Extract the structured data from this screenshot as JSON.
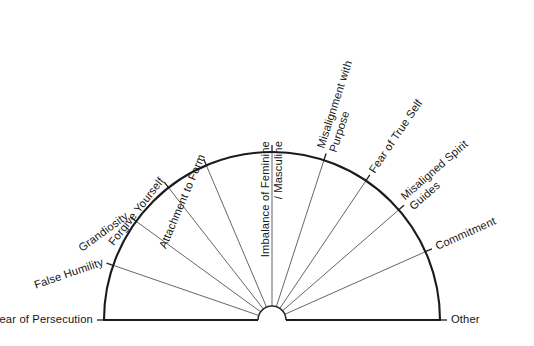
{
  "chart_data": {
    "type": "pie",
    "title": "",
    "subtitle": "",
    "xlabel": "",
    "ylabel": "",
    "orientation": "semicircle-upper",
    "arc_span_degrees": 180,
    "arc_start_degrees": 0,
    "arc_end_degrees": 180,
    "grid": false,
    "legend": "none",
    "style": "hand-drawn pendulum / dowsing chart",
    "center": {
      "x": 272,
      "y": 320
    },
    "radius": 168,
    "hub_radius": 14,
    "stroke_color": "#1a1a1a",
    "spoke_color": "#4a4a4a",
    "background_color": "#ffffff",
    "categories": [
      "Fear of Persecution",
      "False Humility",
      "Grandiosity",
      "Forgive Yourself",
      "Attachment to Form",
      "Imbalance of Feminine / Masculine",
      "Misalignment with Purpose",
      "Fear of True Self",
      "Misaligned Spirit Guides",
      "Commitment",
      "Other"
    ],
    "values": [
      18,
      17,
      16,
      15,
      15,
      15,
      15,
      16,
      17,
      18,
      18
    ],
    "spoke_angles_degrees": [
      180,
      161,
      144,
      128,
      113,
      90,
      72,
      56,
      41,
      24,
      0
    ],
    "sector_count": 10,
    "annotations": []
  },
  "labels": [
    {
      "id": "fear-of-persecution",
      "text": "Fear of Persecution",
      "lines": [
        "Fear of Persecution"
      ],
      "angle_deg": 180,
      "rotation_deg": 0,
      "anchor": "end"
    },
    {
      "id": "false-humility",
      "text": "False Humility",
      "lines": [
        "False Humility"
      ],
      "angle_deg": 161,
      "rotation_deg": -19,
      "anchor": "end"
    },
    {
      "id": "grandiosity",
      "text": "Grandiosity",
      "lines": [
        "Grandiosity"
      ],
      "angle_deg": 144,
      "rotation_deg": -36,
      "anchor": "end"
    },
    {
      "id": "forgive-yourself",
      "text": "Forgive Yourself",
      "lines": [
        "Forgive Yourself"
      ],
      "angle_deg": 128,
      "rotation_deg": -52,
      "anchor": "end"
    },
    {
      "id": "attachment-to-form",
      "text": "Attachment to Form",
      "lines": [
        "Attachment to Form"
      ],
      "angle_deg": 113,
      "rotation_deg": -67,
      "anchor": "end"
    },
    {
      "id": "imbalance-of-feminine-masculine",
      "text": "Imbalance of Feminine / Masculine",
      "lines": [
        "Imbalance of Feminine",
        "/ Masculine"
      ],
      "angle_deg": 90,
      "rotation_deg": -90,
      "anchor": "end"
    },
    {
      "id": "misalignment-with-purpose",
      "text": "Misalignment with Purpose",
      "lines": [
        "Misalignment with",
        "Purpose"
      ],
      "angle_deg": 72,
      "rotation_deg": -72,
      "anchor": "start"
    },
    {
      "id": "fear-of-true-self",
      "text": "Fear of True Self",
      "lines": [
        "Fear of True Self"
      ],
      "angle_deg": 56,
      "rotation_deg": -56,
      "anchor": "start"
    },
    {
      "id": "misaligned-spirit-guides",
      "text": "Misaligned Spirit Guides",
      "lines": [
        "Misaligned Spirit",
        "Guides"
      ],
      "angle_deg": 41,
      "rotation_deg": -41,
      "anchor": "start"
    },
    {
      "id": "commitment",
      "text": "Commitment",
      "lines": [
        "Commitment"
      ],
      "angle_deg": 24,
      "rotation_deg": -24,
      "anchor": "start"
    },
    {
      "id": "other",
      "text": "Other",
      "lines": [
        "Other"
      ],
      "angle_deg": 0,
      "rotation_deg": 0,
      "anchor": "start"
    }
  ],
  "bottom_caption": {
    "text": "",
    "visible": false
  }
}
